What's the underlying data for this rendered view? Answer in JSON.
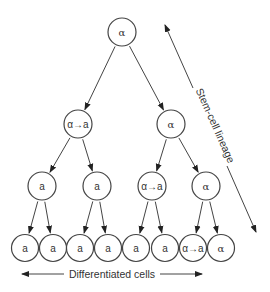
{
  "diagram": {
    "nodes": [
      {
        "id": "n0",
        "label": "α",
        "level": 0,
        "parent": null
      },
      {
        "id": "n1",
        "label": "α→a",
        "level": 1,
        "parent": "n0"
      },
      {
        "id": "n2",
        "label": "α",
        "level": 1,
        "parent": "n0"
      },
      {
        "id": "n3",
        "label": "a",
        "level": 2,
        "parent": "n1"
      },
      {
        "id": "n4",
        "label": "a",
        "level": 2,
        "parent": "n1"
      },
      {
        "id": "n5",
        "label": "α→a",
        "level": 2,
        "parent": "n2"
      },
      {
        "id": "n6",
        "label": "α",
        "level": 2,
        "parent": "n2"
      },
      {
        "id": "n7",
        "label": "a",
        "level": 3,
        "parent": "n3"
      },
      {
        "id": "n8",
        "label": "a",
        "level": 3,
        "parent": "n3"
      },
      {
        "id": "n9",
        "label": "a",
        "level": 3,
        "parent": "n4"
      },
      {
        "id": "n10",
        "label": "a",
        "level": 3,
        "parent": "n4"
      },
      {
        "id": "n11",
        "label": "a",
        "level": 3,
        "parent": "n5"
      },
      {
        "id": "n12",
        "label": "a",
        "level": 3,
        "parent": "n5"
      },
      {
        "id": "n13",
        "label": "α→a",
        "level": 3,
        "parent": "n6"
      },
      {
        "id": "n14",
        "label": "α",
        "level": 3,
        "parent": "n6"
      }
    ],
    "side_axis_label": "Stem-cell lineage",
    "bottom_axis_label": "Differentiated cells"
  }
}
